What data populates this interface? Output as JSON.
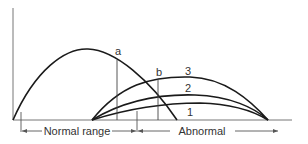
{
  "diagram": {
    "curve_labels": {
      "a": "a",
      "b": "b",
      "c1": "1",
      "c2": "2",
      "c3": "3"
    },
    "range_labels": {
      "normal": "Normal range",
      "abnormal": "Abnormal"
    },
    "colors": {
      "curve": "#1a1a1a",
      "axis": "#777777",
      "text": "#333333",
      "background": "#ffffff"
    }
  }
}
